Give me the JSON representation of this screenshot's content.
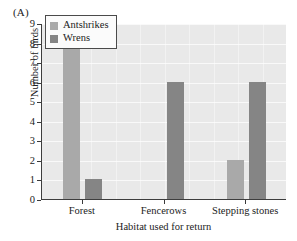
{
  "panel": {
    "label": "(A)"
  },
  "chart_data": {
    "type": "bar",
    "title": "",
    "subtitle": "",
    "panel_label": "(A)",
    "categories": [
      "Forest",
      "Fencerows",
      "Stepping stones"
    ],
    "series": [
      {
        "name": "Antshrikes",
        "color": "#a9a9a9",
        "values": [
          8,
          0,
          2
        ]
      },
      {
        "name": "Wrens",
        "color": "#858585",
        "values": [
          1,
          6,
          6
        ]
      }
    ],
    "xlabel": "Habitat used for return",
    "ylabel": "Number of birds",
    "ylim": [
      0,
      9
    ],
    "ytick_labels": [
      "0",
      "1",
      "2",
      "3",
      "4",
      "5",
      "6",
      "7",
      "8",
      "9"
    ],
    "ytick_values": [
      0,
      1,
      2,
      3,
      4,
      5,
      6,
      7,
      8,
      9
    ],
    "grid": true,
    "legend_position": "upper-left-inside",
    "plot_background": "#e9e9e9",
    "axis_color": "#3d3d3d"
  },
  "legend": {
    "entries": [
      {
        "label": "Antshrikes"
      },
      {
        "label": "Wrens"
      }
    ]
  },
  "axes": {
    "x_title": "Habitat used for return",
    "y_title": "Number of birds"
  }
}
